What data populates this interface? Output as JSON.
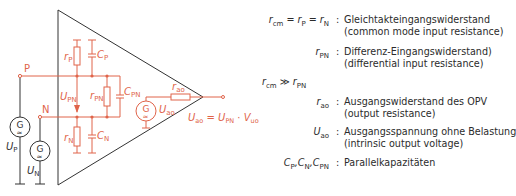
{
  "colors": {
    "circuit_internal": "#e0644a",
    "circuit_external": "#333333",
    "text": "#2b2b2b"
  },
  "circuit": {
    "terminals": {
      "p": "P",
      "n": "N"
    },
    "sources": {
      "up": {
        "glyph": "G",
        "label": "U",
        "sub": "P"
      },
      "un": {
        "glyph": "G",
        "label": "U",
        "sub": "N"
      },
      "uao": {
        "glyph": "G",
        "label": "U",
        "sub": "ao"
      }
    },
    "components": {
      "rp": {
        "label": "r",
        "sub": "P"
      },
      "cp": {
        "label": "C",
        "sub": "P"
      },
      "rpn": {
        "label": "r",
        "sub": "PN"
      },
      "cpn": {
        "label": "C",
        "sub": "PN"
      },
      "rn": {
        "label": "r",
        "sub": "N"
      },
      "cn": {
        "label": "C",
        "sub": "N"
      },
      "rao": {
        "label": "r",
        "sub": "ao"
      }
    },
    "voltage_arrow": {
      "label": "U",
      "sub": "PN"
    },
    "output_equation": {
      "lhs": "U",
      "lhs_sub": "ao",
      "eq": " = ",
      "t1": "U",
      "t1_sub": "PN",
      "dot": " · ",
      "t2": "V",
      "t2_sub": "uo"
    }
  },
  "legend": [
    {
      "symbol_html_parts": [
        "r",
        "cm",
        " = r",
        "P",
        " = r",
        "N"
      ],
      "desc": [
        "Gleichtakteingangswiderstand",
        "(common mode input resistance)"
      ]
    },
    {
      "symbol_html_parts": [
        "r",
        "PN"
      ],
      "desc": [
        "Differenz-Eingangswiderstand)",
        "(differential input resistance)"
      ]
    },
    {
      "relation": [
        "r",
        "cm",
        " ≫ r",
        "PN"
      ]
    },
    {
      "symbol_html_parts": [
        "r",
        "ao"
      ],
      "desc": [
        "Ausgangswiderstand des OPV",
        "(output resistance)"
      ]
    },
    {
      "symbol_html_parts": [
        "U",
        "ao"
      ],
      "desc": [
        "Ausgangsspannung ohne Belastung",
        "(intrinsic output voltage)"
      ]
    },
    {
      "symbol_html_parts": [
        "C",
        "P",
        ",C",
        "N",
        ",C",
        "PN"
      ],
      "desc": [
        "Parallelkapazitäten"
      ]
    }
  ],
  "colon": ":"
}
